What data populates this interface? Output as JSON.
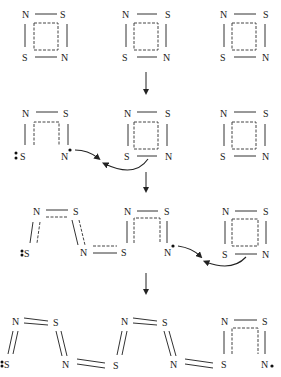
{
  "diagram": {
    "atoms": {
      "nitrogen": "N",
      "sulfur": "S"
    },
    "stages": [
      {
        "label": "stage-1",
        "description": "three S2N2 square rings"
      },
      {
        "label": "stage-2",
        "description": "first ring opened; radical N attacks S of second ring"
      },
      {
        "label": "stage-3",
        "description": "chain of two units; radical N attacks S of third ring"
      },
      {
        "label": "stage-4",
        "description": "extended (SN)x chain with terminal radical N"
      }
    ],
    "colors": {
      "ink": "#222222",
      "background": "#ffffff"
    }
  }
}
